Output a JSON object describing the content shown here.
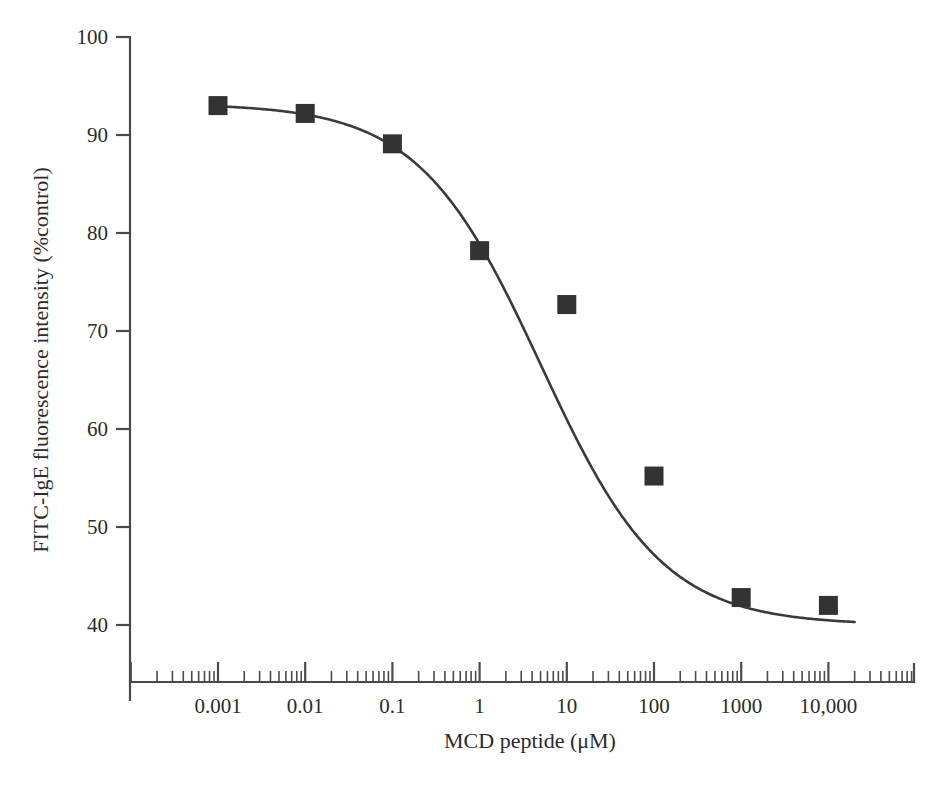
{
  "chart_data": {
    "type": "line",
    "title": "",
    "xlabel": "MCD peptide (μM)",
    "ylabel": "FITC-IgE fluorescence intensity (%control)",
    "x_scale": "log",
    "x": [
      0.001,
      0.01,
      0.1,
      1,
      10,
      100,
      1000,
      10000
    ],
    "values": [
      93.0,
      92.2,
      89.1,
      78.2,
      72.7,
      55.2,
      42.8,
      42.0
    ],
    "series": [
      {
        "name": "FITC-IgE fluorescence intensity (%control)",
        "marker": "filled-square",
        "values": [
          93.0,
          92.2,
          89.1,
          78.2,
          72.7,
          55.2,
          42.8,
          42.0
        ]
      }
    ],
    "xlim": [
      0.0001,
      100000
    ],
    "ylim": [
      38,
      100
    ],
    "xticks": [
      0.001,
      0.01,
      0.1,
      1,
      10,
      100,
      1000,
      10000
    ],
    "xtick_labels": [
      "0.001",
      "0.01",
      "0.1",
      "1",
      "10",
      "100",
      "1000",
      "10,000"
    ],
    "yticks": [
      40,
      50,
      60,
      70,
      80,
      90,
      100
    ],
    "ytick_labels": [
      "40",
      "50",
      "60",
      "70",
      "80",
      "90",
      "100"
    ],
    "grid": false,
    "legend": "none",
    "minor_ticks": "log-decade",
    "fit_curve": "sigmoidal dose-response (four-parameter logistic)",
    "curve_top": 93.2,
    "curve_bottom": 40.0,
    "curve_ec50": 5.0,
    "annotations": []
  },
  "colors": {
    "marker": "#333333",
    "curve": "#3a3a3a",
    "axis": "#4a4a4a",
    "text": "#2b2b2b",
    "background": "#ffffff"
  },
  "axis": {
    "y_title": "FITC-IgE fluorescence intensity (%control)",
    "x_title": "MCD peptide (μM)"
  }
}
